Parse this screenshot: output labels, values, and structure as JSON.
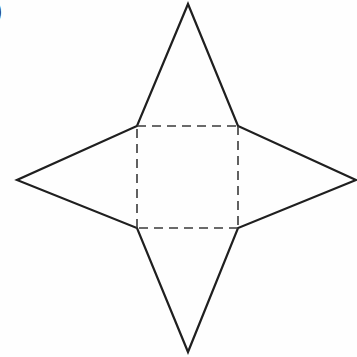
{
  "figure": {
    "label": ")",
    "canvas": {
      "width": 357,
      "height": 357,
      "background": "#fefefe"
    },
    "colors": {
      "solid_stroke": "#1f1f1f",
      "dashed_stroke": "#3a3a3a",
      "fill": "none",
      "label_color": "#2b2b2b"
    },
    "strokes": {
      "solid_width": 2.2,
      "dashed_width": 1.6,
      "dash_pattern": "9,6"
    },
    "star": {
      "name": "four-pointed-star",
      "points": {
        "top": {
          "x": 188,
          "y": 4
        },
        "right": {
          "x": 356,
          "y": 180
        },
        "bottom": {
          "x": 188,
          "y": 352
        },
        "left": {
          "x": 17,
          "y": 180
        }
      },
      "outline_path": "M 188 4 L 238 126 L 356 180 L 238 228 L 188 352 L 137 228 L 17 180 L 137 126 Z"
    },
    "square": {
      "name": "inner-dashed-square",
      "corners": {
        "top_left": {
          "x": 137,
          "y": 126
        },
        "top_right": {
          "x": 238,
          "y": 126
        },
        "bottom_right": {
          "x": 238,
          "y": 228
        },
        "bottom_left": {
          "x": 137,
          "y": 228
        }
      },
      "edges": [
        {
          "name": "top-edge",
          "x1": 137,
          "y1": 126,
          "x2": 238,
          "y2": 126
        },
        {
          "name": "right-edge",
          "x1": 238,
          "y1": 126,
          "x2": 238,
          "y2": 228
        },
        {
          "name": "bottom-edge",
          "x1": 238,
          "y1": 228,
          "x2": 137,
          "y2": 228
        },
        {
          "name": "left-edge",
          "x1": 137,
          "y1": 228,
          "x2": 137,
          "y2": 126
        }
      ]
    }
  }
}
